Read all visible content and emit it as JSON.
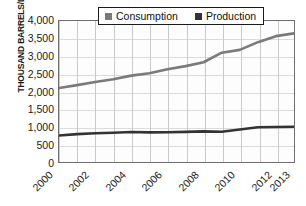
{
  "chart_data": {
    "type": "line",
    "title": "",
    "xlabel": "",
    "ylabel": "THOUSAND BARRELS/DAY",
    "x": [
      2000,
      2001,
      2002,
      2003,
      2004,
      2005,
      2006,
      2007,
      2008,
      2009,
      2010,
      2011,
      2012,
      2013
    ],
    "xtick_labels": [
      "2000",
      "2002",
      "2004",
      "2006",
      "2008",
      "2010",
      "2012",
      "2013"
    ],
    "xtick_years": [
      2000,
      2002,
      2004,
      2006,
      2008,
      2010,
      2012,
      2013
    ],
    "ytick_labels": [
      "4,000",
      "3,500",
      "3,000",
      "2,500",
      "2,000",
      "1,500",
      "1,000",
      "500",
      "0"
    ],
    "ytick_values": [
      4000,
      3500,
      3000,
      2500,
      2000,
      1500,
      1000,
      500,
      0
    ],
    "ylim": [
      0,
      4000
    ],
    "xlim": [
      2000,
      2013
    ],
    "grid": true,
    "legend_position": "top-center",
    "series": [
      {
        "name": "Consumption",
        "color": "#7a7a7a",
        "values": [
          2100,
          2180,
          2270,
          2350,
          2450,
          2520,
          2630,
          2720,
          2830,
          3100,
          3180,
          3400,
          3570,
          3650
        ]
      },
      {
        "name": "Production",
        "color": "#333333",
        "values": [
          750,
          790,
          815,
          830,
          850,
          840,
          845,
          855,
          870,
          860,
          920,
          985,
          995,
          1000
        ]
      }
    ]
  },
  "legend": {
    "items": [
      {
        "label": "Consumption",
        "color": "#7a7a7a"
      },
      {
        "label": "Production",
        "color": "#333333"
      }
    ]
  }
}
